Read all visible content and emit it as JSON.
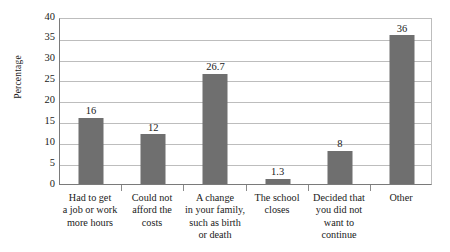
{
  "chart_data": {
    "type": "bar",
    "title": "",
    "xlabel": "",
    "ylabel": "Percentage",
    "ylim": [
      0,
      40
    ],
    "ytick_step": 5,
    "yticks": [
      "40",
      "35",
      "30",
      "25",
      "20",
      "15",
      "10",
      "5",
      "0"
    ],
    "grid": true,
    "legend": "none",
    "bar_color": "#6f6f6f",
    "gridline_color": "#bdbdbd",
    "axis_color": "#7a7a7a",
    "categories": [
      "Had to get\na job or work\nmore hours",
      "Could not\nafford the\ncosts",
      "A change\nin your family,\nsuch as birth\nor death",
      "The school\ncloses",
      "Decided that\nyou did not\nwant to\ncontinue",
      "Other"
    ],
    "category_lines": [
      [
        "Had to get",
        "a job or work",
        "more hours"
      ],
      [
        "Could not",
        "afford the",
        "costs"
      ],
      [
        "A change",
        "in your family,",
        "such as birth",
        "or death"
      ],
      [
        "The school",
        "closes"
      ],
      [
        "Decided that",
        "you did not",
        "want to",
        "continue"
      ],
      [
        "Other"
      ]
    ],
    "values": [
      16,
      12,
      26.7,
      1.3,
      8,
      36
    ],
    "value_labels": [
      "16",
      "12",
      "26.7",
      "1.3",
      "8",
      "36"
    ]
  }
}
